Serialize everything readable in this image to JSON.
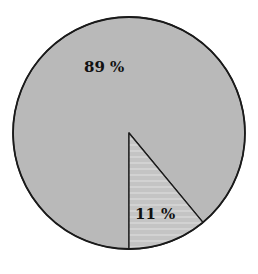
{
  "chart_data": {
    "type": "pie",
    "title": "",
    "categories": [
      "Slice A",
      "Slice B"
    ],
    "values": [
      89,
      11
    ],
    "labels": [
      "89 %",
      "11 %"
    ],
    "unit": "%",
    "start_angle_note": "small slice begins at 6 o'clock and extends counter-clockwise toward the lower right",
    "legend": null,
    "colors": {
      "large_slice": "#b9b9b9",
      "small_slice": "#c4c4c4",
      "small_slice_stripe": "#d2d2d2",
      "outline": "#1a1a1a",
      "background": "#ffffff"
    }
  },
  "geometry": {
    "cx": 129,
    "cy": 133,
    "r": 116
  }
}
